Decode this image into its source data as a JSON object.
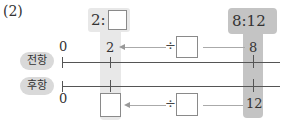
{
  "problem_number": "(2)",
  "ratio_left": {
    "prefix": "2:",
    "blank": ""
  },
  "ratio_right": {
    "text": "8:12"
  },
  "rows": {
    "antecedent": {
      "label": "전항",
      "start": "0",
      "left_value": "2",
      "right_value": "8"
    },
    "consequent": {
      "label": "후항",
      "start": "0",
      "left_value": "",
      "right_value": "12"
    }
  },
  "operations": {
    "top": {
      "symbol": "÷",
      "blank": ""
    },
    "bottom": {
      "symbol": "÷",
      "blank": ""
    }
  },
  "colors": {
    "light_column": "#e8e8e8",
    "dark_column": "#c4c4c4",
    "pill": "#d9d9d9"
  }
}
